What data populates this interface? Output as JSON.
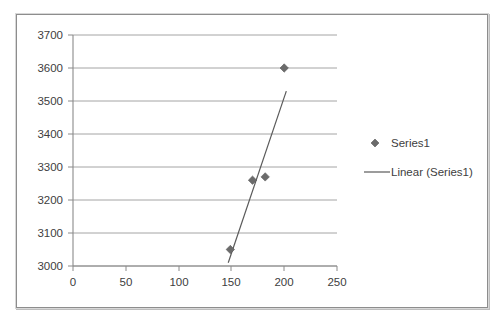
{
  "chart_data": {
    "type": "scatter",
    "title": "",
    "xlabel": "",
    "ylabel": "",
    "xlim": [
      0,
      250
    ],
    "ylim": [
      3000,
      3700
    ],
    "xticks": [
      0,
      50,
      100,
      150,
      200,
      250
    ],
    "yticks": [
      3000,
      3100,
      3200,
      3300,
      3400,
      3500,
      3600,
      3700
    ],
    "xtick_labels": [
      "0",
      "50",
      "100",
      "150",
      "200",
      "250"
    ],
    "ytick_labels": [
      "3000",
      "3100",
      "3200",
      "3300",
      "3400",
      "3500",
      "3600",
      "3700"
    ],
    "grid": "horizontal",
    "legend_position": "right",
    "series": [
      {
        "name": "Series1",
        "type": "scatter",
        "marker": "diamond",
        "color": "#6b6b6b",
        "points": [
          {
            "x": 149,
            "y": 3050
          },
          {
            "x": 170,
            "y": 3260
          },
          {
            "x": 182,
            "y": 3270
          },
          {
            "x": 200,
            "y": 3600
          }
        ]
      },
      {
        "name": "Linear (Series1)",
        "type": "line",
        "color": "#5a5a5a",
        "points": [
          {
            "x": 147,
            "y": 3010
          },
          {
            "x": 202,
            "y": 3530
          }
        ]
      }
    ]
  },
  "legend": {
    "entries": [
      {
        "label": "Series1",
        "marker": "diamond",
        "color": "#6b6b6b"
      },
      {
        "label": "Linear (Series1)",
        "marker": "line",
        "color": "#5a5a5a"
      }
    ]
  },
  "axis": {
    "y_labels": [
      "3700",
      "3600",
      "3500",
      "3400",
      "3300",
      "3200",
      "3100",
      "3000"
    ],
    "x_labels": [
      "0",
      "50",
      "100",
      "150",
      "200",
      "250"
    ]
  },
  "colors": {
    "marker": "#6b6b6b",
    "trendline": "#5a5a5a",
    "gridline": "#9a9a9a",
    "axis": "#8a8a8a",
    "text": "#404040",
    "frame": "#8d8d8d",
    "background": "#ffffff"
  }
}
